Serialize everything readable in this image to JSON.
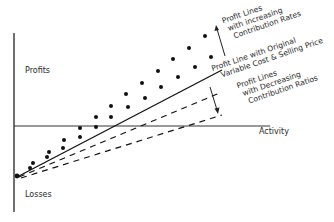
{
  "diagram": {
    "type": "profit-volume graph",
    "axes": {
      "y_top_label": "Profits",
      "y_bottom_label": "Losses",
      "x_label": "Activity"
    },
    "annotations": {
      "increasing": [
        "Profit Lines",
        "with increasing",
        "Contribution Rates"
      ],
      "original": [
        "Profit Line with Original",
        "Variable Cost & Selling Price"
      ],
      "decreasing": [
        "Profit Lines",
        "with Decreasing",
        "Contribution Ratios"
      ]
    },
    "lines": [
      {
        "name": "original",
        "style": "solid",
        "color": "#1a1a1a"
      },
      {
        "name": "decreasing-1",
        "style": "dashed",
        "color": "#1a1a1a"
      },
      {
        "name": "decreasing-2",
        "style": "dashed",
        "color": "#1a1a1a"
      },
      {
        "name": "increasing-1",
        "style": "dotted",
        "color": "#1a1a1a"
      },
      {
        "name": "increasing-2",
        "style": "dotted",
        "color": "#1a1a1a"
      }
    ]
  }
}
